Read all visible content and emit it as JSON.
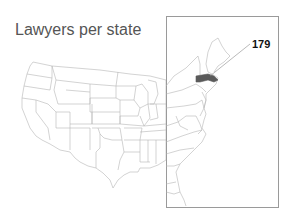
{
  "title": "Lawyers per state",
  "highlight": {
    "state": "Massachusetts",
    "value_label": "179",
    "fill_color": "#5a5a5a"
  },
  "colors": {
    "state_stroke": "#b5b5b5",
    "inset_border": "#9a9a9a",
    "title_color": "#555555"
  }
}
